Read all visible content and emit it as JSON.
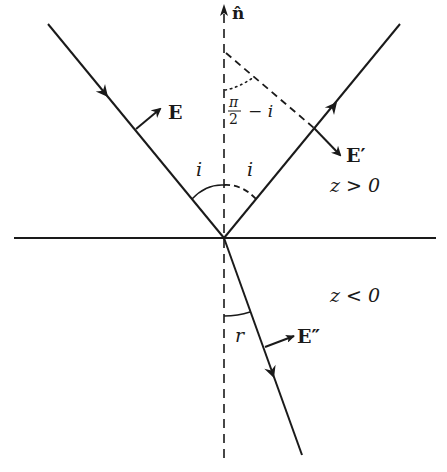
{
  "diagram": {
    "colors": {
      "stroke": "#1a1a1a",
      "background": "#ffffff"
    },
    "labels": {
      "normal": "n̂",
      "incident_field": "E",
      "reflected_field": "E′",
      "transmitted_field": "E″",
      "incidence_angle_left": "i",
      "incidence_angle_right": "i",
      "complement_angle_num": "π",
      "complement_angle_den": "2",
      "complement_angle_rest": "− i",
      "upper_region": "z > 0",
      "lower_region": "z < 0",
      "refraction_angle": "r"
    },
    "elements": [
      {
        "id": "interface",
        "type": "line",
        "style": "solid",
        "from": [
          14,
          238
        ],
        "to": [
          436,
          238
        ]
      },
      {
        "id": "normal",
        "type": "line",
        "style": "dashed",
        "from": [
          224,
          458
        ],
        "to": [
          224,
          8
        ],
        "arrow": "end"
      },
      {
        "id": "incident-ray",
        "type": "line",
        "from": [
          48,
          24
        ],
        "to": [
          224,
          238
        ],
        "arrow": "mid"
      },
      {
        "id": "reflected-ray",
        "type": "line",
        "from": [
          224,
          238
        ],
        "to": [
          400,
          24
        ],
        "arrow": "mid"
      },
      {
        "id": "refracted-ray",
        "type": "line",
        "from": [
          224,
          238
        ],
        "to": [
          302,
          455
        ],
        "arrow": "mid"
      },
      {
        "id": "reflected-normal-construction",
        "type": "line",
        "style": "dashed",
        "from": [
          224,
          52
        ],
        "to": [
          318,
          130
        ]
      }
    ]
  }
}
